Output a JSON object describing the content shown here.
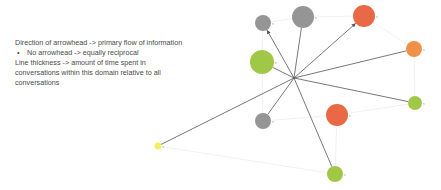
{
  "legend": {
    "line1": "Direction of arrowhead -> primary flow of information",
    "bullet": "No arrowhead -> equally reciprocal",
    "line3": "Line thickness -> amount of time spent in",
    "line4": "conversations within this domain relative to all",
    "line5": "conversations"
  },
  "colors": {
    "gray": "#8f8f8f",
    "green": "#9bc43c",
    "red_orange": "#e8613c",
    "orange": "#f08a3e",
    "yellow": "#f2ee5a",
    "edge": "#555555",
    "faint_edge": "#e6e6e6"
  },
  "graph": {
    "hub": {
      "x": 294,
      "y": 78
    },
    "nodes": [
      {
        "id": "gray-small-top",
        "x": 263,
        "y": 23,
        "r": 8,
        "color": "gray",
        "label": "n"
      },
      {
        "id": "gray-large-top",
        "x": 303,
        "y": 17,
        "r": 11,
        "color": "gray",
        "label": "n"
      },
      {
        "id": "red-top",
        "x": 364,
        "y": 16,
        "r": 11,
        "color": "red_orange",
        "label": "n"
      },
      {
        "id": "green-large-left",
        "x": 262,
        "y": 62,
        "r": 12,
        "color": "green",
        "label": "n"
      },
      {
        "id": "orange-right",
        "x": 414,
        "y": 49,
        "r": 8,
        "color": "orange",
        "label": "n"
      },
      {
        "id": "green-right",
        "x": 415,
        "y": 103,
        "r": 7,
        "color": "green",
        "label": "n"
      },
      {
        "id": "gray-bottom-left",
        "x": 263,
        "y": 121,
        "r": 8,
        "color": "gray",
        "label": "n"
      },
      {
        "id": "red-center",
        "x": 337,
        "y": 115,
        "r": 11,
        "color": "red_orange",
        "label": "n"
      },
      {
        "id": "green-bottom",
        "x": 335,
        "y": 174,
        "r": 8,
        "color": "green",
        "label": "n"
      },
      {
        "id": "yellow-left",
        "x": 158,
        "y": 146,
        "r": 3.5,
        "color": "yellow",
        "label": "n"
      }
    ],
    "edges": [
      {
        "to": "gray-small-top",
        "arrow": true
      },
      {
        "to": "gray-large-top",
        "arrow": false
      },
      {
        "to": "red-top",
        "arrow": true
      },
      {
        "to": "green-large-left",
        "arrow": false
      },
      {
        "to": "orange-right",
        "arrow": false
      },
      {
        "to": "green-right",
        "arrow": false
      },
      {
        "to": "gray-bottom-left",
        "arrow": false
      },
      {
        "to": "green-bottom",
        "arrow": false
      },
      {
        "to": "yellow-left",
        "arrow": false
      }
    ]
  }
}
